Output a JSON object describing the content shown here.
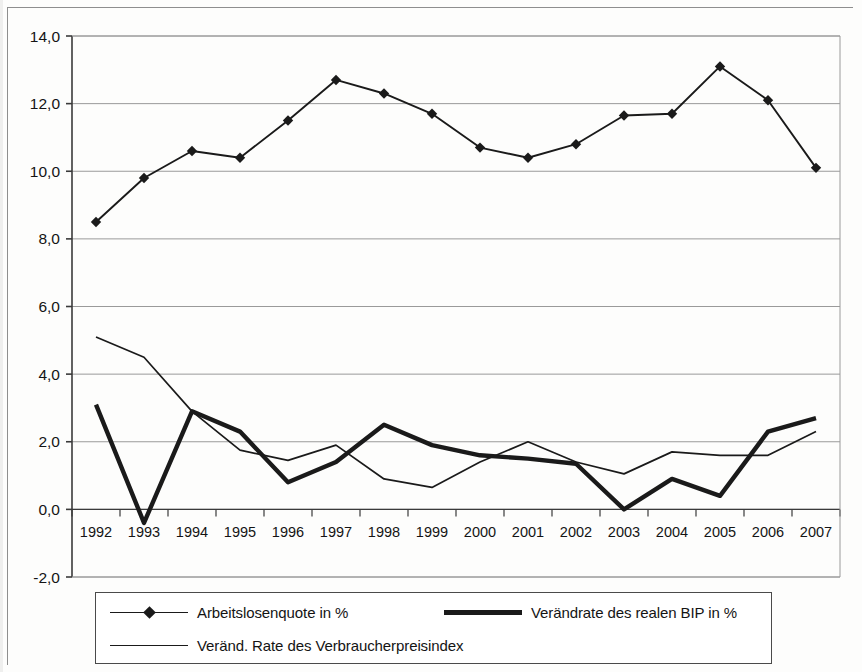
{
  "chart_data": {
    "type": "line",
    "title": "",
    "xlabel": "",
    "ylabel": "",
    "grid": true,
    "legend_position": "bottom",
    "ylim": [
      -2.0,
      14.0
    ],
    "ytick_step": 2.0,
    "ytick_labels": [
      "14,0",
      "12,0",
      "10,0",
      "8,0",
      "6,0",
      "4,0",
      "2,0",
      "0,0",
      "-2,0"
    ],
    "ytick_values": [
      14.0,
      12.0,
      10.0,
      8.0,
      6.0,
      4.0,
      2.0,
      0.0,
      -2.0
    ],
    "categories": [
      "1992",
      "1993",
      "1994",
      "1995",
      "1996",
      "1997",
      "1998",
      "1999",
      "2000",
      "2001",
      "2002",
      "2003",
      "2004",
      "2005",
      "2006",
      "2007"
    ],
    "series": [
      {
        "name": "Arbeitslosenquote in %",
        "marker": "diamond",
        "style": "thin-marker",
        "color": "#1a1a1a",
        "values": [
          8.5,
          9.8,
          10.6,
          10.4,
          11.5,
          12.7,
          12.3,
          11.7,
          10.7,
          10.4,
          10.8,
          11.65,
          11.7,
          13.1,
          12.1,
          10.1
        ]
      },
      {
        "name": "Verändrate des realen BIP in %",
        "marker": "none",
        "style": "thick",
        "color": "#1a1a1a",
        "values": [
          3.1,
          -0.4,
          2.9,
          2.3,
          0.8,
          1.4,
          2.5,
          1.9,
          1.6,
          1.5,
          1.35,
          0.0,
          0.9,
          0.4,
          2.3,
          2.7
        ]
      },
      {
        "name": "Veränd. Rate des Verbraucherpreisindex",
        "marker": "none",
        "style": "thin",
        "color": "#1a1a1a",
        "values": [
          5.1,
          4.5,
          2.9,
          1.75,
          1.45,
          1.9,
          0.9,
          0.65,
          1.4,
          2.0,
          1.4,
          1.05,
          1.7,
          1.6,
          1.6,
          2.3
        ]
      }
    ]
  },
  "legend": {
    "items": [
      {
        "label": "Arbeitslosenquote in %",
        "key": "line-with-diamond-marker"
      },
      {
        "label": "Verändrate des realen BIP in %",
        "key": "thick-line"
      },
      {
        "label": "Veränd. Rate des Verbraucherpreisindex",
        "key": "thin-line"
      }
    ]
  },
  "colors": {
    "ink": "#1a1a1a",
    "grid": "#9a9a9a",
    "axis": "#3a3a3a",
    "background": "#fdfdfc"
  }
}
